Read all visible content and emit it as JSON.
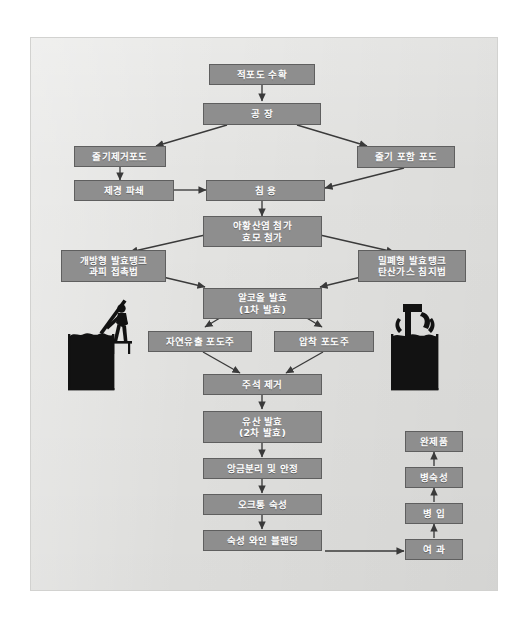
{
  "diagram": {
    "panel_color": "#e3e3e1",
    "node_fill": "#8e8e8e",
    "node_border": "#5f5f5f",
    "node_text_color": "#ffffff",
    "arrow_color": "#3a3a3a",
    "illustration_color": "#1a1a1a"
  },
  "nodes": [
    {
      "id": "harvest",
      "label_lines": [
        "적포도 수확"
      ]
    },
    {
      "id": "winery",
      "label_lines": [
        "공 장"
      ]
    },
    {
      "id": "destemmed",
      "label_lines": [
        "줄기제거포도"
      ]
    },
    {
      "id": "whole-cluster",
      "label_lines": [
        "줄기 포함 포도"
      ]
    },
    {
      "id": "crush",
      "label_lines": [
        "제경 파쇄"
      ]
    },
    {
      "id": "maceration",
      "label_lines": [
        "침 용"
      ]
    },
    {
      "id": "additions",
      "label_lines": [
        "아황산염 첨가",
        "효모  첨가"
      ]
    },
    {
      "id": "open-tank",
      "label_lines": [
        "개방형 발효탱크",
        "과피 접촉법"
      ]
    },
    {
      "id": "closed-tank",
      "label_lines": [
        "밀폐형 발효탱크",
        "탄산가스 침지법"
      ]
    },
    {
      "id": "alc-ferment",
      "label_lines": [
        "알코올 발효",
        "(1차 발효)"
      ]
    },
    {
      "id": "free-run",
      "label_lines": [
        "자연유출 포도주"
      ]
    },
    {
      "id": "press-wine",
      "label_lines": [
        "압착 포도주"
      ]
    },
    {
      "id": "tartrate",
      "label_lines": [
        "주석 제거"
      ]
    },
    {
      "id": "malolactic",
      "label_lines": [
        "유산 발효",
        "(2차 발효)"
      ]
    },
    {
      "id": "racking",
      "label_lines": [
        "앙금분리 및 안정"
      ]
    },
    {
      "id": "oak-aging",
      "label_lines": [
        "오크통 숙성"
      ]
    },
    {
      "id": "blending",
      "label_lines": [
        "숙성 와인 블랜딩"
      ]
    },
    {
      "id": "filtration",
      "label_lines": [
        "여 과"
      ]
    },
    {
      "id": "bottling",
      "label_lines": [
        "병 입"
      ]
    },
    {
      "id": "bottle-aging",
      "label_lines": [
        "병숙성"
      ]
    },
    {
      "id": "finished",
      "label_lines": [
        "완제품"
      ]
    }
  ],
  "illustrations": [
    {
      "id": "open-fermentation-tank-illustration",
      "caption": "개방형 발효탱크 펀칭다운"
    },
    {
      "id": "closed-fermentation-tank-illustration",
      "caption": "밀폐형 발효탱크 가스배출"
    }
  ],
  "flow_edges": [
    {
      "from": "harvest",
      "to": "winery"
    },
    {
      "from": "winery",
      "to": "destemmed"
    },
    {
      "from": "winery",
      "to": "whole-cluster"
    },
    {
      "from": "destemmed",
      "to": "crush"
    },
    {
      "from": "crush",
      "to": "maceration"
    },
    {
      "from": "whole-cluster",
      "to": "maceration"
    },
    {
      "from": "maceration",
      "to": "additions"
    },
    {
      "from": "additions",
      "to": "open-tank"
    },
    {
      "from": "additions",
      "to": "closed-tank"
    },
    {
      "from": "open-tank",
      "to": "alc-ferment"
    },
    {
      "from": "closed-tank",
      "to": "alc-ferment"
    },
    {
      "from": "alc-ferment",
      "to": "free-run"
    },
    {
      "from": "alc-ferment",
      "to": "press-wine"
    },
    {
      "from": "free-run",
      "to": "tartrate"
    },
    {
      "from": "press-wine",
      "to": "tartrate"
    },
    {
      "from": "tartrate",
      "to": "malolactic"
    },
    {
      "from": "malolactic",
      "to": "racking"
    },
    {
      "from": "racking",
      "to": "oak-aging"
    },
    {
      "from": "oak-aging",
      "to": "blending"
    },
    {
      "from": "blending",
      "to": "filtration"
    },
    {
      "from": "filtration",
      "to": "bottling"
    },
    {
      "from": "bottling",
      "to": "bottle-aging"
    },
    {
      "from": "bottle-aging",
      "to": "finished"
    }
  ]
}
